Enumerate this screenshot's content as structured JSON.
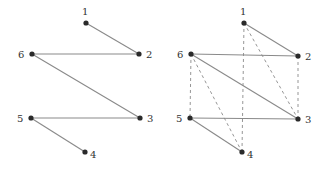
{
  "colors": {
    "edge": "#8a8a8a",
    "node": "#2a2a2a",
    "label": "#333333",
    "background": "#ffffff"
  },
  "graphs": [
    {
      "name": "left-graph",
      "nodes": [
        {
          "id": "1",
          "label": "1",
          "x": 86,
          "y": 23,
          "lx": 82,
          "ly": 15,
          "anchor": "start"
        },
        {
          "id": "2",
          "label": "2",
          "x": 139,
          "y": 54,
          "lx": 146,
          "ly": 58,
          "anchor": "start"
        },
        {
          "id": "3",
          "label": "3",
          "x": 140,
          "y": 118,
          "lx": 147,
          "ly": 122,
          "anchor": "start"
        },
        {
          "id": "4",
          "label": "4",
          "x": 85,
          "y": 152,
          "lx": 90,
          "ly": 158,
          "anchor": "start"
        },
        {
          "id": "5",
          "label": "5",
          "x": 31,
          "y": 118,
          "lx": 17,
          "ly": 122,
          "anchor": "start"
        },
        {
          "id": "6",
          "label": "6",
          "x": 32,
          "y": 54,
          "lx": 18,
          "ly": 58,
          "anchor": "start"
        }
      ],
      "solid_edges": [
        [
          "1",
          "2"
        ],
        [
          "2",
          "6"
        ],
        [
          "6",
          "3"
        ],
        [
          "3",
          "5"
        ],
        [
          "5",
          "4"
        ]
      ],
      "dashed_edges": []
    },
    {
      "name": "right-graph",
      "nodes": [
        {
          "id": "1",
          "label": "1",
          "x": 244,
          "y": 23,
          "lx": 240,
          "ly": 15,
          "anchor": "start"
        },
        {
          "id": "2",
          "label": "2",
          "x": 298,
          "y": 56,
          "lx": 305,
          "ly": 60,
          "anchor": "start"
        },
        {
          "id": "3",
          "label": "3",
          "x": 298,
          "y": 119,
          "lx": 305,
          "ly": 123,
          "anchor": "start"
        },
        {
          "id": "4",
          "label": "4",
          "x": 242,
          "y": 152,
          "lx": 247,
          "ly": 158,
          "anchor": "start"
        },
        {
          "id": "5",
          "label": "5",
          "x": 190,
          "y": 118,
          "lx": 176,
          "ly": 122,
          "anchor": "start"
        },
        {
          "id": "6",
          "label": "6",
          "x": 191,
          "y": 54,
          "lx": 177,
          "ly": 58,
          "anchor": "start"
        }
      ],
      "solid_edges": [
        [
          "1",
          "2"
        ],
        [
          "2",
          "6"
        ],
        [
          "6",
          "3"
        ],
        [
          "3",
          "5"
        ],
        [
          "5",
          "4"
        ]
      ],
      "dashed_edges": [
        [
          "1",
          "4"
        ],
        [
          "1",
          "3"
        ],
        [
          "2",
          "3"
        ],
        [
          "6",
          "5"
        ],
        [
          "6",
          "4"
        ]
      ]
    }
  ]
}
